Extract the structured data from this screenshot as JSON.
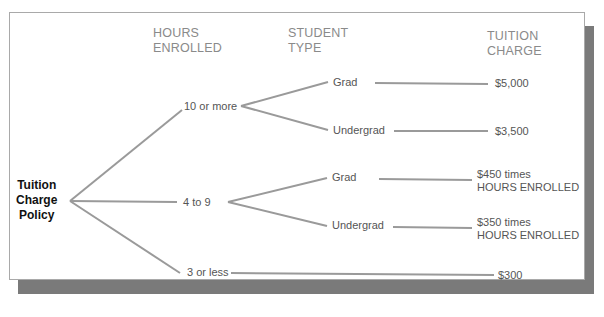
{
  "headers": {
    "hours": [
      "HOURS",
      "ENROLLED"
    ],
    "student": [
      "STUDENT",
      "TYPE"
    ],
    "tuition": [
      "TUITION",
      "CHARGE"
    ]
  },
  "root": [
    "Tuition",
    "Charge",
    "Policy"
  ],
  "hours_nodes": [
    "10 or more",
    "4 to 9",
    "3 or less"
  ],
  "student_nodes": {
    "ten_plus": [
      "Grad",
      "Undergrad"
    ],
    "four_to_nine": [
      "Grad",
      "Undergrad"
    ]
  },
  "charges": {
    "ten_grad": "$5,000",
    "ten_undergrad": "$3,500",
    "four_grad": [
      "$450 times",
      "HOURS ENROLLED"
    ],
    "four_undergrad": [
      "$350 times",
      "HOURS ENROLLED"
    ],
    "three_or_less": "$300"
  },
  "colors": {
    "line": "#9a9a9a",
    "shadow": "#7a7a7a"
  }
}
